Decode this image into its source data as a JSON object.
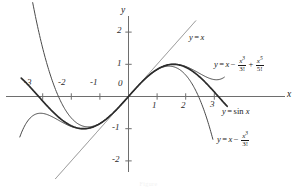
{
  "chart_data": {
    "type": "line",
    "title": "",
    "xlabel": "x",
    "ylabel": "y",
    "xlim": [
      -3.9,
      3.6
    ],
    "ylim": [
      -2.6,
      2.5
    ],
    "grid": false,
    "legend": "inline-annotations",
    "xticks": [
      -3,
      -2,
      -1,
      0,
      1,
      2,
      3
    ],
    "yticks": [
      2,
      1,
      0,
      -1,
      -2
    ],
    "xtick_labels": [
      "-3",
      "-2",
      "-1",
      "0",
      "1",
      "2",
      "3"
    ],
    "ytick_labels": [
      "2",
      "1",
      "0",
      "-1",
      "-2"
    ],
    "series": [
      {
        "name": "y = x",
        "formula": "x",
        "kind": "line",
        "domain": [
          -2.55,
          2.35
        ],
        "color": "#7a7a7a",
        "width": 0.9
      },
      {
        "name": "y = sin x",
        "formula": "sin(x)",
        "kind": "sine",
        "domain": [
          -3.75,
          3.45
        ],
        "color": "#2b2b2b",
        "width": 1.7
      },
      {
        "name": "y = x - x^3/3!",
        "formula": "x - x^3/6",
        "kind": "taylor3",
        "domain": [
          -3.35,
          2.95
        ],
        "color": "#4a4a4a",
        "width": 1.0
      },
      {
        "name": "y = x - x^3/3! + x^5/5!",
        "formula": "x - x^3/6 + x^5/120",
        "kind": "taylor5",
        "domain": [
          -3.8,
          3.35
        ],
        "color": "#4a4a4a",
        "width": 1.0
      }
    ],
    "annotations": [
      {
        "id": "line-label",
        "text": "y = x"
      },
      {
        "id": "taylor5-label",
        "text": "y = x - x^3/3! + x^5/5!"
      },
      {
        "id": "sin-label",
        "text": "y = sin x"
      },
      {
        "id": "taylor3-label",
        "text": "y = x - x^3/3!"
      }
    ]
  },
  "figure": {
    "axis_x_label": "x",
    "axis_y_label": "y",
    "xticks": [
      "-3",
      "-2",
      "-1",
      "1",
      "2",
      "3"
    ],
    "origin_label": "0",
    "yticks": [
      "2",
      "1",
      "-1",
      "-2"
    ],
    "labels": {
      "line": {
        "lhs": "y",
        "eq": "=",
        "rhs": "x"
      },
      "taylor5": {
        "lhs": "y",
        "eq": "=",
        "x": "x",
        "minus": "−",
        "plus": "+",
        "f1_num": "x",
        "f1_num_exp": "3",
        "f1_den": "3!",
        "f2_num": "x",
        "f2_num_exp": "5",
        "f2_den": "5!"
      },
      "sin": {
        "lhs": "y",
        "eq": "=",
        "rhs": "sin",
        "arg": "x"
      },
      "taylor3": {
        "lhs": "y",
        "eq": "=",
        "x": "x",
        "minus": "−",
        "f1_num": "x",
        "f1_num_exp": "3",
        "f1_den": "3!"
      }
    },
    "caption": "Figure"
  },
  "colors": {
    "axis": "#6e6e6e",
    "sin_curve": "#2b2b2b",
    "taylor_curve": "#4a4a4a",
    "line_curve": "#8a8a8a",
    "text": "#1a1a1a",
    "background": "#ffffff"
  }
}
